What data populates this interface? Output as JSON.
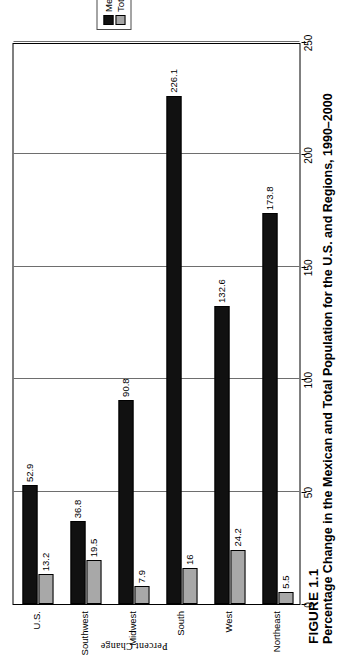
{
  "figure": {
    "number": "FIGURE 1.1",
    "caption": "Percentage Change in the Mexican and Total Population for the U.S. and Regions, 1990–2000"
  },
  "legend": {
    "position": "top-right",
    "items": [
      {
        "label": "Mexican Pop.",
        "color": "#111111"
      },
      {
        "label": "Total Pop.",
        "color": "#a8a8a8"
      }
    ]
  },
  "axis": {
    "value_axis_title": "Percent Change",
    "ticks": [
      "0",
      "50",
      "100",
      "150",
      "200",
      "250"
    ]
  },
  "chart_data": {
    "type": "bar",
    "orientation": "horizontal",
    "title": "Percentage Change in the Mexican and Total Population for the U.S. and Regions, 1990–2000",
    "xlabel": "Percent Change",
    "ylabel": "",
    "xlim": [
      0,
      250
    ],
    "grid": true,
    "legend_position": "top-right",
    "categories": [
      "U.S.",
      "Southwest",
      "Midwest",
      "South",
      "West",
      "Northeast"
    ],
    "series": [
      {
        "name": "Mexican Pop.",
        "color": "#111111",
        "values": [
          52.9,
          36.8,
          90.8,
          226.1,
          132.6,
          173.8
        ]
      },
      {
        "name": "Total Pop.",
        "color": "#a8a8a8",
        "values": [
          13.2,
          19.5,
          7.9,
          16,
          24.2,
          5.5
        ]
      }
    ],
    "data_labels": {
      "Mexican Pop.": [
        "52.9",
        "36.8",
        "90.8",
        "226.1",
        "132.6",
        "173.8"
      ],
      "Total Pop.": [
        "13.2",
        "19.5",
        "7.9",
        "16",
        "24.2",
        "5.5"
      ]
    }
  }
}
